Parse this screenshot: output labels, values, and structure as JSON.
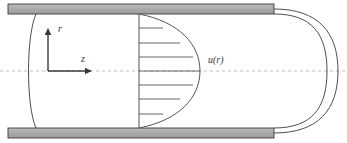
{
  "figure": {
    "canvas": {
      "width": 347,
      "height": 143,
      "background": "#ffffff"
    },
    "colors": {
      "wall_fill": "#a8a8a8",
      "wall_fill_light": "#c2c2c2",
      "outline": "#3a3a3a",
      "centerline": "#c9b8b8",
      "profile_line": "#555555",
      "axis": "#3a3a3a",
      "text": "#3a3a3a"
    },
    "labels": {
      "radial_axis": "r",
      "axial_axis": "z",
      "velocity_profile": "u(r)"
    },
    "geometry": {
      "pipe_top_wall": {
        "x": 8,
        "y": 4,
        "width": 266,
        "height": 10
      },
      "pipe_bottom_wall": {
        "x": 8,
        "y": 128,
        "width": 266,
        "height": 10
      },
      "centerline_y": 71,
      "centerline_x_start": 0,
      "centerline_x_end": 347,
      "centerline_dash": "3,3",
      "origin": {
        "x": 48,
        "y": 71
      },
      "r_axis_tip": {
        "x": 48,
        "y": 27
      },
      "z_axis_tip": {
        "x": 93,
        "y": 71
      },
      "profile_base_x": 139,
      "profile_apex_x": 200,
      "profile_top_y": 14,
      "profile_bottom_y": 128,
      "left_cap_bulge_x": 28,
      "right_cap_outer_x": 338,
      "right_cap_inner_x": 327
    },
    "velocity_vectors": {
      "count": 7,
      "base_x": 139,
      "items": [
        {
          "y": 28,
          "tip_x": 163,
          "label": "velocity-arrow-1"
        },
        {
          "y": 43,
          "tip_x": 180,
          "label": "velocity-arrow-2"
        },
        {
          "y": 57,
          "tip_x": 193,
          "label": "velocity-arrow-3"
        },
        {
          "y": 71,
          "tip_x": 200,
          "label": "velocity-arrow-4"
        },
        {
          "y": 85,
          "tip_x": 193,
          "label": "velocity-arrow-5"
        },
        {
          "y": 99,
          "tip_x": 180,
          "label": "velocity-arrow-6"
        },
        {
          "y": 114,
          "tip_x": 163,
          "label": "velocity-arrow-7"
        }
      ]
    },
    "label_positions": {
      "radial_axis": {
        "x": 58,
        "y": 32
      },
      "axial_axis": {
        "x": 81,
        "y": 62
      },
      "velocity_profile": {
        "x": 208,
        "y": 63
      }
    }
  }
}
